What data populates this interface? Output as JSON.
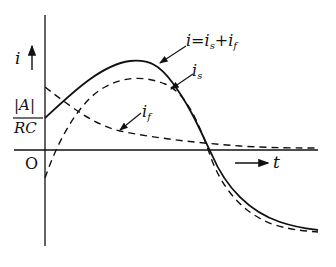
{
  "diagram": {
    "y_axis_label": "i",
    "x_axis_label": "t",
    "origin_label": "O",
    "y_marker": {
      "numerator": "|A|",
      "denominator": "RC"
    },
    "curves": [
      {
        "name": "total",
        "label_main": "i=i",
        "label_sub1": "s",
        "label_plus": "+i",
        "label_sub2": "f",
        "style": "solid"
      },
      {
        "name": "steady",
        "label_main": "i",
        "label_sub": "s",
        "style": "dashed"
      },
      {
        "name": "free",
        "label_main": "i",
        "label_sub": "f",
        "style": "dashed"
      }
    ],
    "colors": {
      "ink": "#111111",
      "background": "#ffffff"
    }
  }
}
